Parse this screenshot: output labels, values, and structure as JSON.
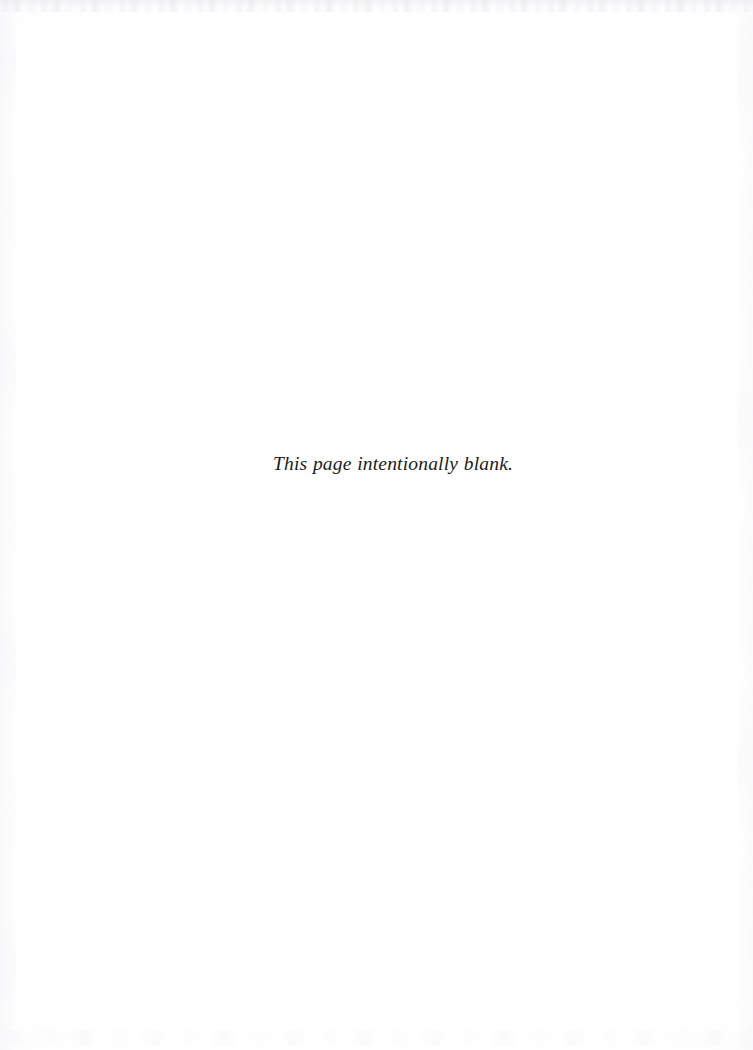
{
  "page": {
    "kind": "scanned-book-page",
    "width": 753,
    "height": 1050,
    "background_color": "#ffffff",
    "text_color": "#1c1c1c"
  },
  "content": {
    "notice": "This page intentionally blank."
  },
  "artifacts": {
    "top_edge": "faint-gray-speckle-band",
    "left_edge": "faint-vertical-mottling",
    "right_edge": "faint-vertical-mottling",
    "bottom_edge": "faint-bleed-through-smudge"
  }
}
